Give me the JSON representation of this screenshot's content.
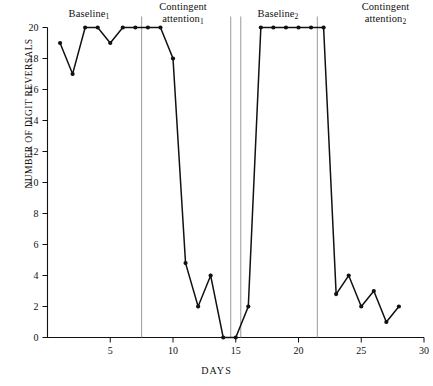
{
  "chart_data": {
    "type": "line",
    "title": "",
    "xlabel": "DAYS",
    "ylabel": "NUMBER OF DIGIT REVERSALS",
    "xlim": [
      0,
      30
    ],
    "ylim": [
      0,
      20
    ],
    "xticks": [
      5,
      10,
      15,
      20,
      25,
      30
    ],
    "yticks": [
      0,
      2,
      4,
      6,
      8,
      10,
      12,
      14,
      16,
      18,
      20
    ],
    "grid": false,
    "legend": "none",
    "x": [
      1,
      2,
      3,
      4,
      5,
      6,
      7,
      8,
      9,
      10,
      11,
      12,
      13,
      14,
      15,
      16,
      17,
      18,
      19,
      20,
      21,
      22,
      23,
      24,
      25,
      26,
      27,
      28
    ],
    "values": [
      19,
      17,
      20,
      20,
      19,
      20,
      20,
      20,
      20,
      18,
      4.8,
      2,
      4,
      0,
      0,
      2,
      20,
      20,
      20,
      20,
      20,
      20,
      2.8,
      4,
      2,
      3,
      1,
      2
    ],
    "series": [
      {
        "name": "Number of digit reversals",
        "x": [
          1,
          2,
          3,
          4,
          5,
          6,
          7,
          8,
          9,
          10,
          11,
          12,
          13,
          14,
          15,
          16,
          17,
          18,
          19,
          20,
          21,
          22,
          23,
          24,
          25,
          26,
          27,
          28
        ],
        "values": [
          19,
          17,
          20,
          20,
          19,
          20,
          20,
          20,
          20,
          18,
          4.8,
          2,
          4,
          0,
          0,
          2,
          20,
          20,
          20,
          20,
          20,
          20,
          2.8,
          4,
          2,
          3,
          1,
          2
        ]
      }
    ],
    "phases": [
      {
        "name": "Baseline",
        "subscript": "1",
        "label": "Baseline",
        "day_start": 1,
        "day_end": 7,
        "values": [
          19,
          17,
          20,
          20,
          19,
          20,
          20
        ]
      },
      {
        "name": "Contingent attention",
        "subscript": "1",
        "label": "Contingent attention",
        "day_start": 8,
        "day_end": 15,
        "values": [
          20,
          20,
          18,
          4.8,
          2,
          4,
          0,
          0
        ]
      },
      {
        "name": "Baseline",
        "subscript": "2",
        "label": "Baseline",
        "day_start": 16,
        "day_end": 21,
        "values": [
          2,
          20,
          20,
          20,
          20,
          20
        ]
      },
      {
        "name": "Contingent attention",
        "subscript": "2",
        "label": "Contingent attention",
        "day_start": 22,
        "day_end": 28,
        "values": [
          20,
          2.8,
          4,
          2,
          3,
          1,
          2
        ]
      }
    ],
    "phase_dividers": [
      7.5,
      14.6,
      15.4,
      21.5
    ],
    "colors": {
      "line": "#111111",
      "marker": "#111111",
      "axis": "#111111",
      "divider": "#8d8d8d",
      "background": "#ffffff"
    }
  },
  "labels": {
    "baseline1_text": "Baseline",
    "baseline1_sub": "1",
    "contingent1_line1": "Contingent",
    "contingent1_line2": "attention",
    "contingent1_sub": "1",
    "baseline2_text": "Baseline",
    "baseline2_sub": "2",
    "contingent2_line1": "Contingent",
    "contingent2_line2": "attention",
    "contingent2_sub": "2",
    "y_axis_title": "NUMBER OF DIGIT REVERSALS",
    "x_axis_title": "DAYS"
  },
  "ytick_labels": [
    "0",
    "2",
    "4",
    "6",
    "8",
    "10",
    "12",
    "14",
    "16",
    "18",
    "20"
  ],
  "xtick_labels": [
    "5",
    "10",
    "15",
    "20",
    "25",
    "30"
  ]
}
